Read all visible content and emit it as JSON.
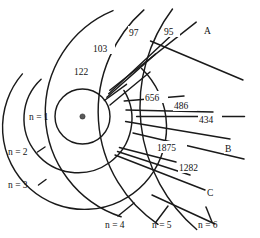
{
  "diagram": {
    "nucleus_label": "nucleus",
    "shell_labels": [
      {
        "id": "n1",
        "text": "n = 1"
      },
      {
        "id": "n2",
        "text": "n = 2"
      },
      {
        "id": "n3",
        "text": "n = 3"
      },
      {
        "id": "n4",
        "text": "n = 4"
      },
      {
        "id": "n5",
        "text": "n = 5"
      },
      {
        "id": "n6",
        "text": "n = 6"
      }
    ],
    "series_labels": [
      {
        "id": "A",
        "text": "A"
      },
      {
        "id": "B",
        "text": "B"
      },
      {
        "id": "C",
        "text": "C"
      }
    ],
    "wavelengths": [
      {
        "id": "w122",
        "text": "122",
        "series": "A",
        "from": 2,
        "to": 1
      },
      {
        "id": "w103",
        "text": "103",
        "series": "A",
        "from": 3,
        "to": 1
      },
      {
        "id": "w97",
        "text": "97",
        "series": "A",
        "from": 4,
        "to": 1
      },
      {
        "id": "w95",
        "text": "95",
        "series": "A",
        "from": 5,
        "to": 1
      },
      {
        "id": "w656",
        "text": "656",
        "series": "B",
        "from": 3,
        "to": 2
      },
      {
        "id": "w486",
        "text": "486",
        "series": "B",
        "from": 4,
        "to": 2
      },
      {
        "id": "w434",
        "text": "434",
        "series": "B",
        "from": 5,
        "to": 2
      },
      {
        "id": "w1875",
        "text": "1875",
        "series": "C",
        "from": 4,
        "to": 3
      },
      {
        "id": "w1282",
        "text": "1282",
        "series": "C",
        "from": 5,
        "to": 3
      }
    ],
    "colors": {
      "stroke": "#1a1a1a",
      "background": "#ffffff",
      "nucleus": "#5a5a5a"
    }
  }
}
